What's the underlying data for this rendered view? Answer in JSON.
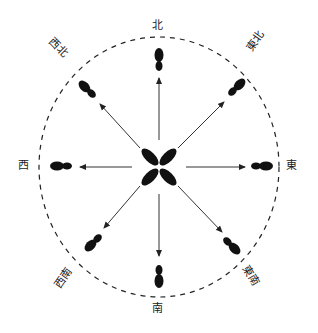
{
  "diagram": {
    "type": "compass-footprint-directions",
    "center": {
      "x": 159,
      "y": 167
    },
    "boundary": {
      "shape": "dashed-ellipse",
      "rx": 120,
      "ry": 130
    },
    "ink_color": "#111111",
    "arrow_color": "#333333",
    "directions": [
      {
        "id": "north",
        "label": "北",
        "angle": -90
      },
      {
        "id": "northeast",
        "label": "東北",
        "angle": -45
      },
      {
        "id": "east",
        "label": "東",
        "angle": 0
      },
      {
        "id": "southeast",
        "label": "東南",
        "angle": 45
      },
      {
        "id": "south",
        "label": "南",
        "angle": 90
      },
      {
        "id": "southwest",
        "label": "西南",
        "angle": 135
      },
      {
        "id": "west",
        "label": "西",
        "angle": 180
      },
      {
        "id": "northwest",
        "label": "西北",
        "angle": -135
      }
    ],
    "labels": {
      "north": "北",
      "northeast": "東北",
      "east": "東",
      "southeast": "東南",
      "south": "南",
      "southwest": "西南",
      "west": "西",
      "northwest": "西北"
    }
  }
}
